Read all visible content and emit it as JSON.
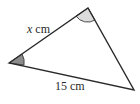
{
  "diagram": {
    "type": "triangle",
    "vertices": {
      "left": [
        9,
        63
      ],
      "top": [
        88,
        8
      ],
      "right": [
        134,
        90
      ]
    },
    "side_labels": {
      "left_top": {
        "variable": "x",
        "unit": " cm"
      },
      "left_right": {
        "value": "15 cm"
      }
    },
    "angle_marks": [
      {
        "vertex": "left",
        "fill": "#8c8c8c"
      },
      {
        "vertex": "top",
        "fill": "#dcdcdc"
      }
    ],
    "colors": {
      "stroke": "#2a2a2a",
      "dark_angle": "#8c8c8c",
      "light_angle": "#dcdcdc"
    }
  }
}
